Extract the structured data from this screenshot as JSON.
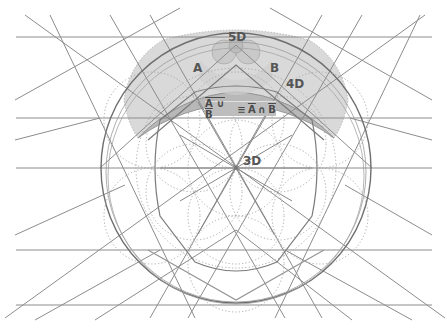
{
  "diagram": {
    "title": "",
    "labels": {
      "a": "A",
      "b": "B",
      "five_d": "5D",
      "four_d": "4D",
      "three_d": "3D"
    },
    "formula": {
      "left_overlined": "A ∪ B",
      "equiv": "≡",
      "right_a": "A",
      "cap": "∩",
      "right_b": "B"
    },
    "colors": {
      "background": "#ffffff",
      "line": "#8a8a8a",
      "dark_line": "#6e6e6e",
      "dotted": "#aaaaaa",
      "shade": "#d6d6d6",
      "shade_dark": "#bdbdbd",
      "label": "#555555"
    }
  }
}
